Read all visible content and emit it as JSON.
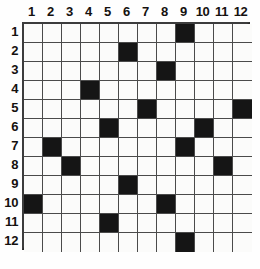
{
  "puzzle": {
    "title": "12x12 grid puzzle",
    "grid_size": 12,
    "column_headers": [
      "1",
      "2",
      "3",
      "4",
      "5",
      "6",
      "7",
      "8",
      "9",
      "10",
      "11",
      "12"
    ],
    "row_headers": [
      "1",
      "2",
      "3",
      "4",
      "5",
      "6",
      "7",
      "8",
      "9",
      "10",
      "11",
      "12"
    ],
    "colors": {
      "filled_cell": "#151515",
      "empty_cell": "#fbfbfa",
      "grid_line": "#4a4a4a",
      "border": "#2a2a2a",
      "label_text": "#15110f",
      "background": "#fefefe"
    },
    "filled_cells": [
      {
        "row": 1,
        "col": 9
      },
      {
        "row": 2,
        "col": 6
      },
      {
        "row": 3,
        "col": 8
      },
      {
        "row": 4,
        "col": 4
      },
      {
        "row": 5,
        "col": 7
      },
      {
        "row": 5,
        "col": 12
      },
      {
        "row": 6,
        "col": 5
      },
      {
        "row": 6,
        "col": 10
      },
      {
        "row": 7,
        "col": 2
      },
      {
        "row": 7,
        "col": 9
      },
      {
        "row": 8,
        "col": 3
      },
      {
        "row": 8,
        "col": 11
      },
      {
        "row": 9,
        "col": 6
      },
      {
        "row": 10,
        "col": 1
      },
      {
        "row": 10,
        "col": 8
      },
      {
        "row": 11,
        "col": 5
      },
      {
        "row": 12,
        "col": 9
      }
    ],
    "filled_count": 17
  }
}
